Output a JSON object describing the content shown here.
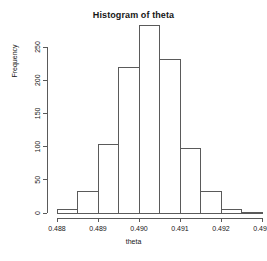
{
  "chart_data": {
    "type": "bar",
    "title": "Histogram of theta",
    "xlabel": "theta",
    "ylabel": "Frequency",
    "grid": false,
    "legend": false,
    "bin_width": 0.0005,
    "bin_edges": [
      0.488,
      0.4885,
      0.489,
      0.4895,
      0.49,
      0.4905,
      0.491,
      0.4915,
      0.492,
      0.4925,
      0.493
    ],
    "categories": [
      "0.4880-0.4885",
      "0.4885-0.4890",
      "0.4890-0.4895",
      "0.4895-0.4900",
      "0.4900-0.4905",
      "0.4905-0.4910",
      "0.4910-0.4915",
      "0.4915-0.4920",
      "0.4920-0.4925",
      "0.4925-0.4930"
    ],
    "values": [
      5,
      32,
      103,
      219,
      283,
      231,
      97,
      32,
      5,
      1
    ],
    "xlim": [
      0.488,
      0.493
    ],
    "ylim": [
      0,
      283
    ],
    "xticks": [
      0.488,
      0.489,
      0.49,
      0.491,
      0.492,
      0.493
    ],
    "xticklabels": [
      "0.488",
      "0.489",
      "0.490",
      "0.491",
      "0.492",
      "0.493"
    ],
    "yticks": [
      0,
      50,
      100,
      150,
      200,
      250
    ],
    "yticklabels": [
      "0",
      "50",
      "100",
      "150",
      "200",
      "250"
    ]
  },
  "colors": {
    "background": "#ffffff",
    "bar_fill": "#ffffff",
    "bar_stroke": "#5a5a5a",
    "axis": "#5a5a5a",
    "text": "#161616"
  }
}
